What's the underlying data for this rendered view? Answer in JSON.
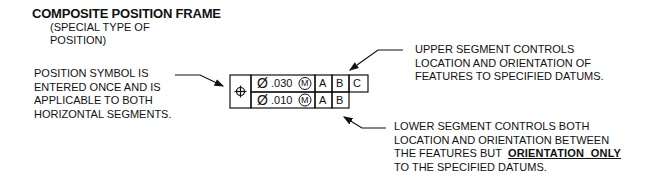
{
  "title": "COMPOSITE POSITION FRAME",
  "subtitle": [
    "(SPECIAL TYPE OF",
    "POSITION)"
  ],
  "left_note": {
    "lines": [
      "POSITION SYMBOL IS",
      "ENTERED ONCE AND IS",
      "APPLICABLE TO BOTH",
      "HORIZONTAL SEGMENTS."
    ]
  },
  "upper_note": {
    "lines": [
      "UPPER SEGMENT CONTROLS",
      "LOCATION AND ORIENTATION  OF",
      "FEATURES TO SPECIFIED DATUMS."
    ]
  },
  "lower_note": {
    "line1": "LOWER SEGMENT CONTROLS BOTH",
    "line2": "LOCATION AND ORIENTATION  BETWEEN",
    "line3_prefix": "THE FEATURES BUT  ",
    "line3_emphasis": "ORIENTATION  ONLY",
    "line4": "TO THE SPECIFIED DATUMS."
  },
  "frame": {
    "symbol": "position-symbol",
    "upper_row": {
      "diameter": "Ø",
      "tolerance": ".030",
      "modifier": "M",
      "datums": [
        "A",
        "B",
        "C"
      ]
    },
    "lower_row": {
      "diameter": "Ø",
      "tolerance": ".010",
      "modifier": "M",
      "datums": [
        "A",
        "B"
      ]
    }
  }
}
